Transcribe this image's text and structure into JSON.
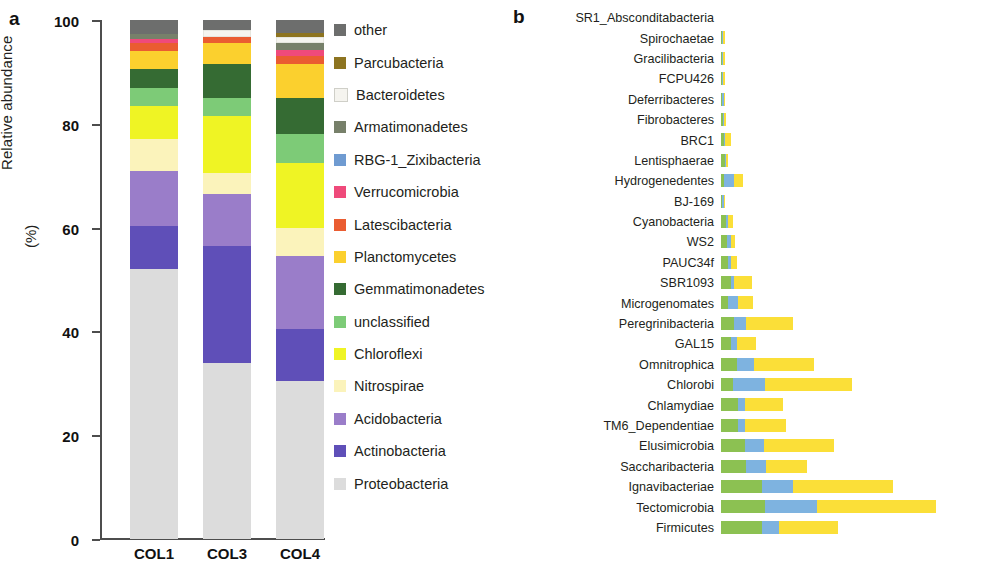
{
  "panel_a": {
    "letter": "a",
    "y_axis_title_line1": "Relative abundance",
    "y_axis_title_line2": "(%)",
    "y_ticks": [
      "0",
      "20",
      "40",
      "60",
      "80",
      "100"
    ],
    "y_min": 0,
    "y_max": 100,
    "categories": [
      "COL1",
      "COL3",
      "COL4"
    ],
    "legend": [
      {
        "label": "other",
        "color": "#6d6e6d"
      },
      {
        "label": "Parcubacteria",
        "color": "#8d7420"
      },
      {
        "label": "Bacteroidetes",
        "color": "#f5f4ef"
      },
      {
        "label": "Armatimonadetes",
        "color": "#77806a"
      },
      {
        "label": "RBG-1_Zixibacteria",
        "color": "#6f9bd1"
      },
      {
        "label": "Verrucomicrobia",
        "color": "#ef4a7b"
      },
      {
        "label": "Latescibacteria",
        "color": "#ea5c31"
      },
      {
        "label": "Planctomycetes",
        "color": "#fbd02e"
      },
      {
        "label": "Gemmatimonadetes",
        "color": "#356b33"
      },
      {
        "label": "unclassified",
        "color": "#7dcb77"
      },
      {
        "label": "Chloroflexi",
        "color": "#eff424"
      },
      {
        "label": "Nitrospirae",
        "color": "#fbf3bb"
      },
      {
        "label": "Acidobacteria",
        "color": "#9a7dc9"
      },
      {
        "label": "Actinobacteria",
        "color": "#5f4fb8"
      },
      {
        "label": "Proteobacteria",
        "color": "#dcdcdc"
      }
    ]
  },
  "panel_b": {
    "letter": "b",
    "x_axis_title": "Relative abundance (%)",
    "x_ticks": [
      "0",
      "0.5",
      "1.0",
      "1.5"
    ],
    "x_min": 0,
    "x_max": 1.5,
    "legend": [
      {
        "label": "COL1",
        "color": "#8cc152"
      },
      {
        "label": "COL3",
        "color": "#7eb3e0"
      },
      {
        "label": "COL4",
        "color": "#fbdf38"
      }
    ]
  },
  "chart_data": [
    {
      "type": "bar",
      "stacked": true,
      "orientation": "vertical",
      "title": "",
      "xlabel": "",
      "ylabel": "Relative abundance (%)",
      "ylim": [
        0,
        100
      ],
      "grid": false,
      "legend_position": "right",
      "categories": [
        "COL1",
        "COL3",
        "COL4"
      ],
      "series": [
        {
          "name": "Proteobacteria",
          "color": "#dcdcdc",
          "values": [
            52.0,
            34.0,
            30.5
          ]
        },
        {
          "name": "Actinobacteria",
          "color": "#5f4fb8",
          "values": [
            8.3,
            22.5,
            10.0
          ]
        },
        {
          "name": "Acidobacteria",
          "color": "#9a7dc9",
          "values": [
            10.6,
            10.0,
            14.0
          ]
        },
        {
          "name": "Nitrospirae",
          "color": "#fbf3bb",
          "values": [
            6.1,
            4.0,
            5.5
          ]
        },
        {
          "name": "Chloroflexi",
          "color": "#eff424",
          "values": [
            6.5,
            11.0,
            12.5
          ]
        },
        {
          "name": "unclassified",
          "color": "#7dcb77",
          "values": [
            3.5,
            3.5,
            5.5
          ]
        },
        {
          "name": "Gemmatimonadetes",
          "color": "#356b33",
          "values": [
            3.5,
            6.5,
            7.0
          ]
        },
        {
          "name": "Planctomycetes",
          "color": "#fbd02e",
          "values": [
            3.5,
            4.0,
            6.5
          ]
        },
        {
          "name": "Latescibacteria",
          "color": "#ea5c31",
          "values": [
            1.5,
            1.3,
            1.5
          ]
        },
        {
          "name": "Verrucomicrobia",
          "color": "#ef4a7b",
          "values": [
            0.8,
            0.0,
            1.3
          ]
        },
        {
          "name": "RBG-1_Zixibacteria",
          "color": "#6f9bd1",
          "values": [
            0.0,
            0.0,
            0.0
          ]
        },
        {
          "name": "Armatimonadetes",
          "color": "#77806a",
          "values": [
            1.0,
            0.0,
            1.2
          ]
        },
        {
          "name": "Bacteroidetes",
          "color": "#f5f4ef",
          "values": [
            0.0,
            1.2,
            1.3
          ]
        },
        {
          "name": "Parcubacteria",
          "color": "#8d7420",
          "values": [
            0.0,
            0.0,
            0.7
          ]
        },
        {
          "name": "other",
          "color": "#6d6e6d",
          "values": [
            2.7,
            2.0,
            2.5
          ]
        }
      ]
    },
    {
      "type": "bar",
      "stacked": true,
      "orientation": "horizontal",
      "title": "",
      "xlabel": "Relative abundance (%)",
      "ylabel": "",
      "xlim": [
        0,
        1.5
      ],
      "grid": false,
      "legend_position": "top-right",
      "categories": [
        "SR1_Absconditabacteria",
        "Spirochaetae",
        "Gracilibacteria",
        "FCPU426",
        "Deferribacteres",
        "Fibrobacteres",
        "BRC1",
        "Lentisphaerae",
        "Hydrogenedentes",
        "BJ-169",
        "Cyanobacteria",
        "WS2",
        "PAUC34f",
        "SBR1093",
        "Microgenomates",
        "Peregrinibacteria",
        "GAL15",
        "Omnitrophica",
        "Chlorobi",
        "Chlamydiae",
        "TM6_Dependentiae",
        "Elusimicrobia",
        "Saccharibacteria",
        "Ignavibacteriae",
        "Tectomicrobia",
        "Firmicutes"
      ],
      "series": [
        {
          "name": "COL1",
          "color": "#8cc152",
          "values": [
            0.0,
            0.006,
            0.003,
            0.002,
            0.008,
            0.012,
            0.016,
            0.022,
            0.018,
            0.008,
            0.03,
            0.035,
            0.04,
            0.055,
            0.04,
            0.075,
            0.06,
            0.09,
            0.07,
            0.095,
            0.1,
            0.14,
            0.145,
            0.235,
            0.25,
            0.235
          ]
        },
        {
          "name": "COL3",
          "color": "#7eb3e0",
          "values": [
            0.0,
            0.002,
            0.002,
            0.001,
            0.004,
            0.006,
            0.008,
            0.006,
            0.055,
            0.004,
            0.01,
            0.02,
            0.015,
            0.02,
            0.055,
            0.07,
            0.03,
            0.1,
            0.18,
            0.04,
            0.035,
            0.105,
            0.11,
            0.18,
            0.3,
            0.095
          ]
        },
        {
          "name": "COL4",
          "color": "#fbdf38",
          "values": [
            0.0,
            0.004,
            0.002,
            0.002,
            0.008,
            0.012,
            0.035,
            0.01,
            0.055,
            0.004,
            0.03,
            0.025,
            0.035,
            0.1,
            0.09,
            0.27,
            0.11,
            0.34,
            0.5,
            0.22,
            0.24,
            0.4,
            0.24,
            0.57,
            0.68,
            0.34
          ]
        }
      ]
    }
  ]
}
